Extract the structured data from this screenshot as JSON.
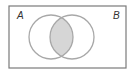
{
  "diagram": {
    "type": "venn",
    "universe": {
      "x": 9,
      "y": 6,
      "width": 117,
      "height": 62,
      "stroke": "#7a7a7a"
    },
    "sets": [
      {
        "label": "A",
        "cx": 51,
        "cy": 37,
        "r": 22,
        "label_x": 17,
        "label_y": 19
      },
      {
        "label": "B",
        "cx": 72,
        "cy": 37,
        "r": 22,
        "label_x": 113,
        "label_y": 19
      }
    ],
    "circle_stroke": "#a8a8a8",
    "shaded_region": "A ∩ B",
    "shade_color": "#d6d6d6"
  }
}
